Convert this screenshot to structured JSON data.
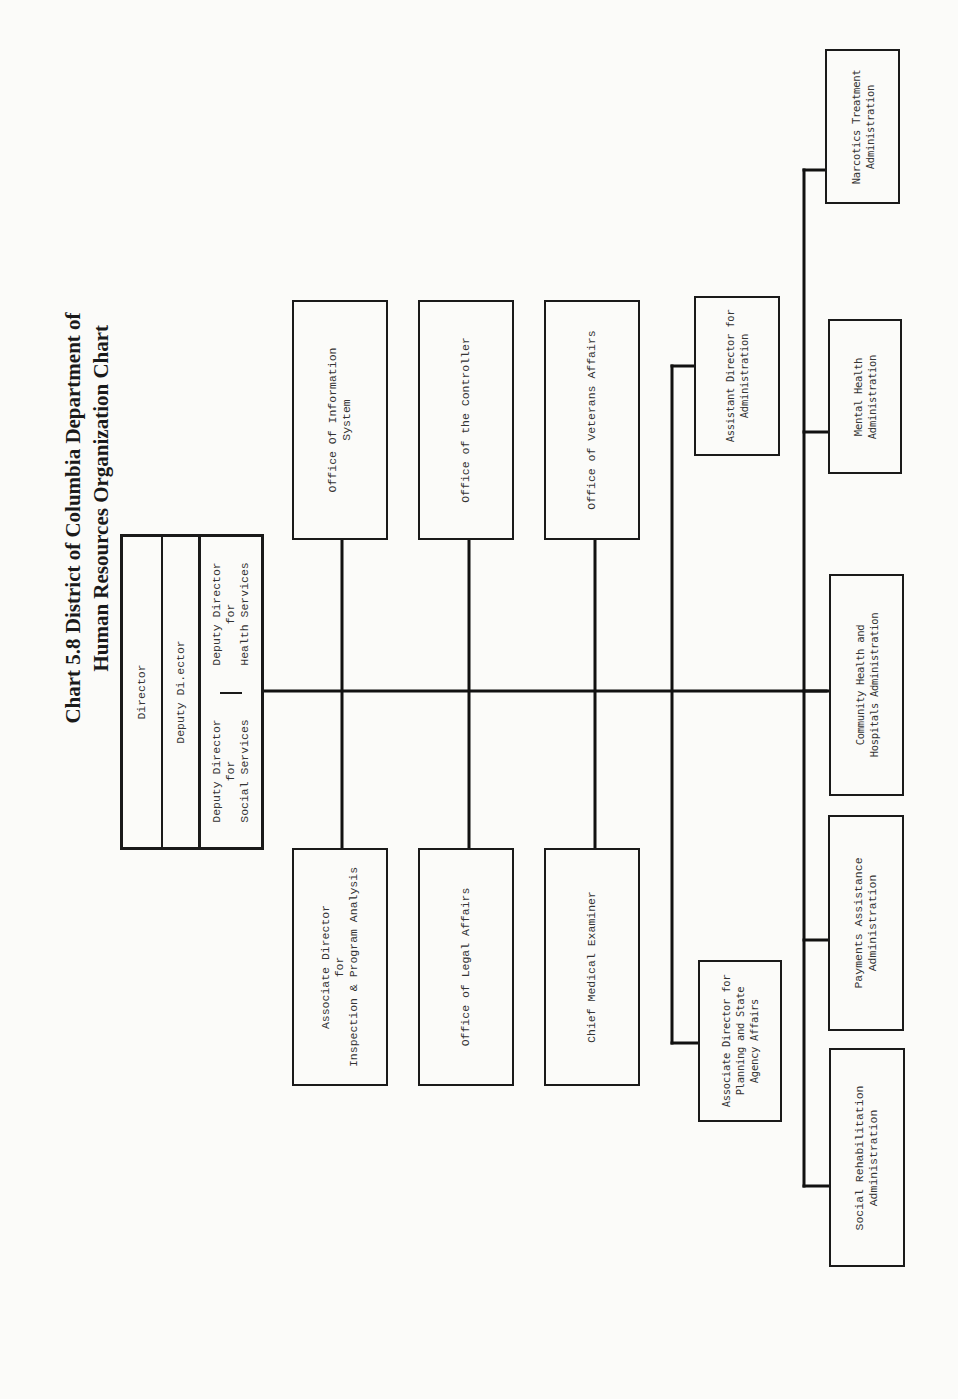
{
  "title": {
    "line1": "Chart 5.8  District of Columbia Department of",
    "line2": "Human Resources Organization Chart"
  },
  "leadership": {
    "director": "Director",
    "deputy_director": "Deputy Di.ector",
    "deputy_social": [
      "Deputy Director",
      "for",
      "Social Services"
    ],
    "deputy_health": [
      "Deputy Director",
      "for",
      "Health Services"
    ]
  },
  "staff_offices": {
    "top": [
      {
        "lines": [
          "Office Of Information",
          "System"
        ]
      },
      {
        "lines": [
          "Office of the Controller"
        ]
      },
      {
        "lines": [
          "Office of Veterans Affairs"
        ]
      },
      {
        "lines": [
          "Assistant Director for",
          "Administration"
        ]
      }
    ],
    "bottom": [
      {
        "lines": [
          "Associate Director",
          "for",
          "Inspection & Program Analysis"
        ]
      },
      {
        "lines": [
          "Office of Legal Affairs"
        ]
      },
      {
        "lines": [
          "Chief Medical Examiner"
        ]
      },
      {
        "lines": [
          "Associate Director for",
          "Planning and State",
          "Agency Affairs"
        ]
      }
    ]
  },
  "administrations": [
    {
      "lines": [
        "Narcotics Treatment",
        "Administration"
      ]
    },
    {
      "lines": [
        "Mental Health",
        "Administration"
      ]
    },
    {
      "lines": [
        "Community Health and",
        "Hospitals Administration"
      ]
    },
    {
      "lines": [
        "Payments Assistance",
        "Administration"
      ]
    },
    {
      "lines": [
        "Social Rehabilitation",
        "Administration"
      ]
    }
  ]
}
